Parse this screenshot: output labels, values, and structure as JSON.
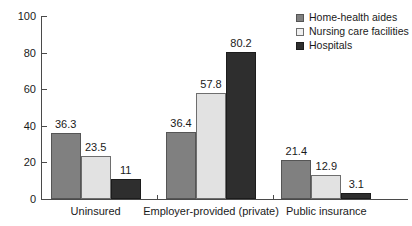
{
  "chart_data": {
    "type": "bar",
    "title": "",
    "subtitle": "",
    "xlabel": "",
    "ylabel": "",
    "ylim": [
      0,
      100
    ],
    "ytick_labels": [
      "0",
      "20",
      "40",
      "60",
      "80",
      "100"
    ],
    "ytick_values": [
      0,
      20,
      40,
      60,
      80,
      100
    ],
    "grid": false,
    "legend_position": "top-right",
    "categories": [
      "Uninsured",
      "Employer-provided (private)",
      "Public insurance"
    ],
    "series": [
      {
        "name": "Home-health aides",
        "color": "#808080",
        "values": [
          36.3,
          36.4,
          21.4
        ],
        "labels": [
          "36.3",
          "36.4",
          "21.4"
        ]
      },
      {
        "name": "Nursing care facilities",
        "color": "#e2e2e2",
        "values": [
          23.5,
          57.8,
          12.9
        ],
        "labels": [
          "23.5",
          "57.8",
          "12.9"
        ]
      },
      {
        "name": "Hospitals",
        "color": "#2e2e2e",
        "values": [
          11,
          80.2,
          3.1
        ],
        "labels": [
          "11",
          "80.2",
          "3.1"
        ]
      }
    ]
  },
  "legend": {
    "items": [
      {
        "label": "Home-health aides"
      },
      {
        "label": "Nursing care facilities"
      },
      {
        "label": "Hospitals"
      }
    ]
  },
  "axis": {
    "y_labels": [
      "100",
      "80",
      "60",
      "40",
      "20",
      "0"
    ]
  }
}
